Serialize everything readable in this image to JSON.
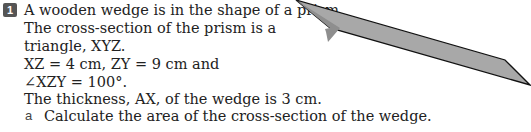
{
  "question": {
    "number": "1",
    "lines": [
      "A wooden wedge is in the shape of a prism.",
      "The cross-section of the prism is a",
      "triangle, XYZ.",
      "XZ = 4 cm, ZY = 9 cm and",
      "∠XZY = 100°.",
      "The thickness, AX, of the wedge is 3 cm."
    ],
    "parts": [
      {
        "letter": "a",
        "text": "Calculate the area of the cross-section of the wedge."
      }
    ]
  },
  "diagram": {
    "labels": {
      "A": "A",
      "X": "X",
      "Z": "Z",
      "thickness": "3 cm",
      "xz": "4 cm",
      "zy": "9 cm",
      "angle": "100°"
    },
    "fill_color": "#9a9a9a"
  },
  "hint": {
    "text": "To revise the compound"
  }
}
